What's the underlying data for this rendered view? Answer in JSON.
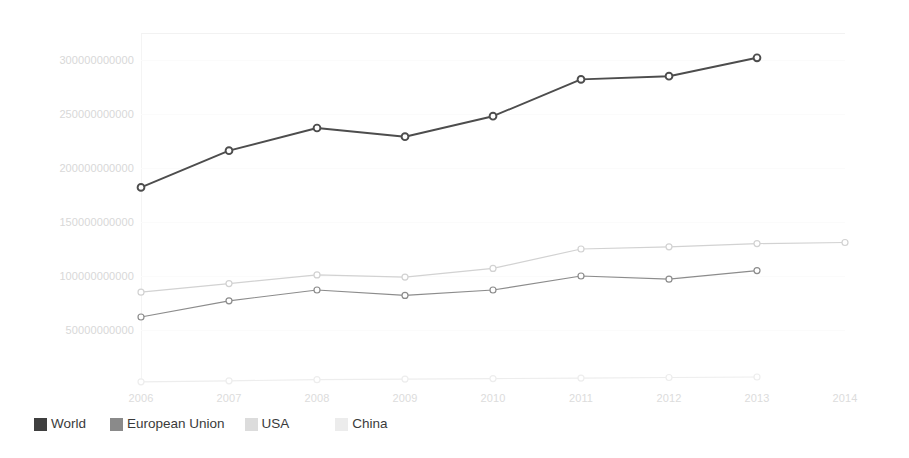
{
  "chart_data": {
    "type": "line",
    "title": "",
    "xlabel": "",
    "ylabel": "",
    "x": [
      2006,
      2007,
      2008,
      2009,
      2010,
      2011,
      2012,
      2013,
      2014
    ],
    "categories": [
      "2006",
      "2007",
      "2008",
      "2009",
      "2010",
      "2011",
      "2012",
      "2013",
      "2014"
    ],
    "xlim": [
      2006,
      2014
    ],
    "ylim": [
      0,
      325000000000
    ],
    "ytick_values": [
      50000000000,
      100000000000,
      150000000000,
      200000000000,
      250000000000,
      300000000000
    ],
    "ytick_labels": [
      "50000000000",
      "100000000000",
      "150000000000",
      "200000000000",
      "250000000000",
      "300000000000"
    ],
    "grid": true,
    "legend_position": "bottom-left",
    "series": [
      {
        "name": "World",
        "color": "#4d4d4d",
        "marker": "open-circle",
        "values": [
          182000000000,
          216000000000,
          237000000000,
          229000000000,
          248000000000,
          282000000000,
          285000000000,
          302000000000,
          null
        ]
      },
      {
        "name": "European Union",
        "color": "#8c8c8c",
        "marker": "open-circle",
        "values": [
          62000000000,
          77000000000,
          87000000000,
          82000000000,
          87000000000,
          100000000000,
          97000000000,
          105000000000,
          null
        ]
      },
      {
        "name": "USA",
        "color": "#d2d2d2",
        "marker": "open-circle",
        "values": [
          85000000000,
          93000000000,
          101000000000,
          99000000000,
          107000000000,
          125000000000,
          127000000000,
          130000000000,
          131000000000
        ]
      },
      {
        "name": "China",
        "color": "#ededed",
        "marker": "open-circle",
        "values": [
          2000000000,
          3000000000,
          4000000000,
          4500000000,
          5000000000,
          5500000000,
          6000000000,
          6500000000,
          null
        ]
      }
    ]
  },
  "legend": {
    "items": [
      {
        "label": "World",
        "color": "#3f3f3f"
      },
      {
        "label": "European Union",
        "color": "#8a8a8a"
      },
      {
        "label": "USA",
        "color": "#dcdcdc"
      },
      {
        "label": "China",
        "color": "#ececec"
      }
    ]
  }
}
